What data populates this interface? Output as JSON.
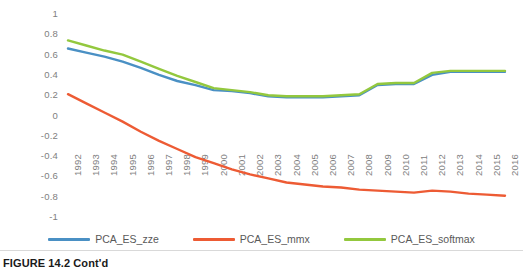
{
  "caption": {
    "figure_label": "FIGURE 14.2",
    "continued": "Cont'd"
  },
  "legend": {
    "position": "bottom",
    "items": [
      {
        "label": "PCA_ES_zze",
        "color": "#4a90c4"
      },
      {
        "label": "PCA_ES_mmx",
        "color": "#ed5b34"
      },
      {
        "label": "PCA_ES_softmax",
        "color": "#93c83e"
      }
    ]
  },
  "chart_data": {
    "type": "line",
    "title": "",
    "xlabel": "",
    "ylabel": "",
    "ylim": [
      -1,
      1
    ],
    "ytick_labels": [
      "1",
      "0.8",
      "0.6",
      "0.4",
      "0.2",
      "0",
      "-0.2",
      "-0.4",
      "-0.6",
      "-0.8",
      "-1"
    ],
    "ytick_values": [
      1,
      0.8,
      0.6,
      0.4,
      0.2,
      0,
      -0.2,
      -0.4,
      -0.6,
      -0.8,
      -1
    ],
    "grid": false,
    "legend_position": "bottom",
    "categories": [
      "1992",
      "1993",
      "1994",
      "1995",
      "1996",
      "1997",
      "1998",
      "1999",
      "2000",
      "2001",
      "2002",
      "2003",
      "2004",
      "2005",
      "2006",
      "2007",
      "2008",
      "2009",
      "2010",
      "2011",
      "2012",
      "2013",
      "2014",
      "2015",
      "2016"
    ],
    "series": [
      {
        "name": "PCA_ES_zze",
        "color": "#4a90c4",
        "values": [
          0.66,
          0.62,
          0.58,
          0.53,
          0.47,
          0.4,
          0.34,
          0.3,
          0.25,
          0.24,
          0.22,
          0.19,
          0.18,
          0.18,
          0.18,
          0.19,
          0.2,
          0.3,
          0.31,
          0.31,
          0.4,
          0.43,
          0.43,
          0.43,
          0.43
        ]
      },
      {
        "name": "PCA_ES_mmx",
        "color": "#ed5b34",
        "values": [
          0.21,
          0.12,
          0.03,
          -0.06,
          -0.16,
          -0.25,
          -0.33,
          -0.41,
          -0.47,
          -0.53,
          -0.58,
          -0.62,
          -0.66,
          -0.68,
          -0.7,
          -0.71,
          -0.73,
          -0.74,
          -0.75,
          -0.76,
          -0.74,
          -0.75,
          -0.77,
          -0.78,
          -0.79
        ]
      },
      {
        "name": "PCA_ES_softmax",
        "color": "#93c83e",
        "values": [
          0.74,
          0.69,
          0.64,
          0.6,
          0.53,
          0.46,
          0.39,
          0.33,
          0.27,
          0.25,
          0.23,
          0.2,
          0.19,
          0.19,
          0.19,
          0.2,
          0.21,
          0.31,
          0.32,
          0.32,
          0.42,
          0.44,
          0.44,
          0.44,
          0.44
        ]
      }
    ]
  }
}
